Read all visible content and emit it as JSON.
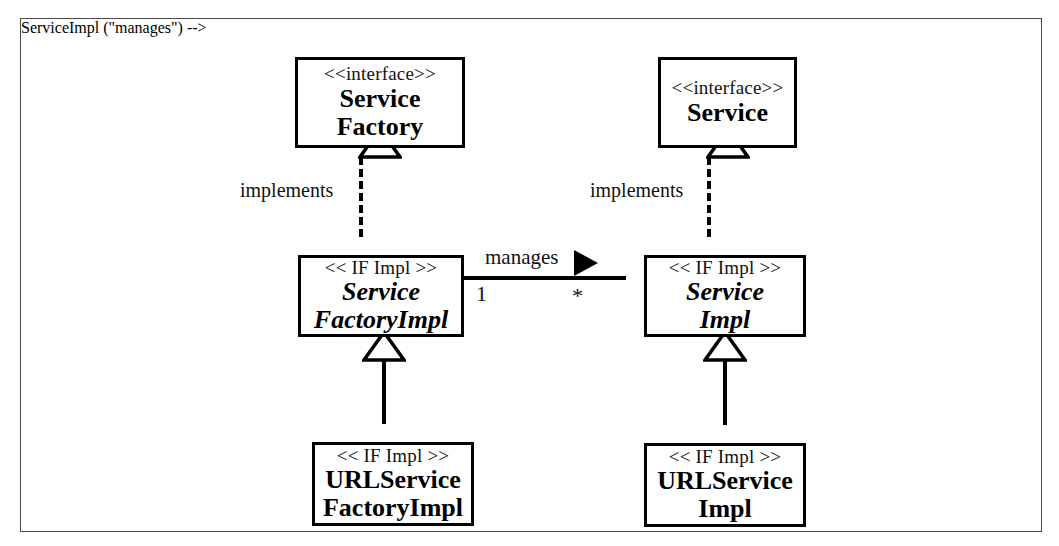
{
  "diagram": {
    "kind": "uml-class-diagram",
    "frame_border_color": "#4a4a4a",
    "line_color": "#000000",
    "background": "#ffffff",
    "classes": [
      {
        "id": "service-factory",
        "stereotype": "<<interface>>",
        "name_line1": "Service",
        "name_line2": "Factory",
        "italic": false
      },
      {
        "id": "service",
        "stereotype": "<<interface>>",
        "name_line1": "Service",
        "name_line2": "",
        "italic": false
      },
      {
        "id": "service-factory-impl",
        "stereotype": "<< IF Impl >>",
        "name_line1": "Service",
        "name_line2": "FactoryImpl",
        "italic": true
      },
      {
        "id": "service-impl",
        "stereotype": "<< IF Impl >>",
        "name_line1": "Service",
        "name_line2": "Impl",
        "italic": true
      },
      {
        "id": "url-service-factory-impl",
        "stereotype": "<< IF Impl >>",
        "name_line1": "URLService",
        "name_line2": "FactoryImpl",
        "italic": false
      },
      {
        "id": "url-service-impl",
        "stereotype": "<< IF Impl >>",
        "name_line1": "URLService",
        "name_line2": "Impl",
        "italic": false
      }
    ],
    "relationships": {
      "implements_left_label": "implements",
      "implements_right_label": "implements",
      "association_label": "manages",
      "multiplicity_source": "1",
      "multiplicity_target": "*"
    }
  }
}
